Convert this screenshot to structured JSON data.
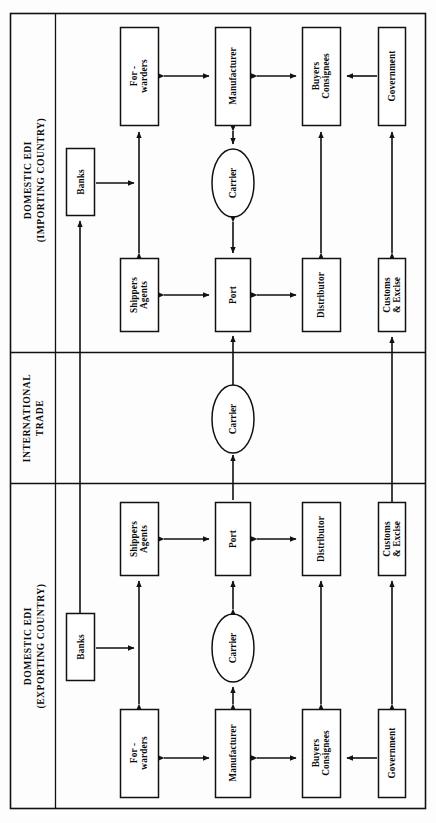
{
  "diagram": {
    "type": "block-flow-diagram",
    "orientation": "rotated-90-ccw",
    "colors": {
      "stroke": "#111111",
      "background": "#fdfdfd",
      "node_fill": "#ffffff",
      "text": "#0b0b0b"
    },
    "sections": [
      {
        "id": "importing",
        "label": "DOMESTIC EDI\n(IMPORTING COUNTRY)",
        "label_line1": "DOMESTIC EDI",
        "label_line2": "(IMPORTING COUNTRY)"
      },
      {
        "id": "international",
        "label": "INTERNATIONAL\nTRADE",
        "label_line1": "INTERNATIONAL",
        "label_line2": "TRADE"
      },
      {
        "id": "exporting",
        "label": "DOMESTIC EDI\n(EXPORTING COUNTRY)",
        "label_line1": "DOMESTIC EDI",
        "label_line2": "(EXPORTING COUNTRY)"
      }
    ],
    "nodes": [
      {
        "id": "imp-forwarders",
        "label": "For -\nwarders",
        "shape": "rect",
        "section": "importing"
      },
      {
        "id": "imp-manufacturer",
        "label": "Manufacturer",
        "shape": "rect",
        "section": "importing"
      },
      {
        "id": "imp-buyers",
        "label": "Buyers\nConsignees",
        "shape": "rect",
        "section": "importing"
      },
      {
        "id": "imp-government",
        "label": "Government",
        "shape": "rect",
        "section": "importing"
      },
      {
        "id": "imp-banks",
        "label": "Banks",
        "shape": "rect",
        "section": "importing"
      },
      {
        "id": "imp-carrier",
        "label": "Carrier",
        "shape": "ellipse",
        "section": "importing"
      },
      {
        "id": "imp-shippers",
        "label": "Shippers\nAgents",
        "shape": "rect",
        "section": "importing"
      },
      {
        "id": "imp-port",
        "label": "Port",
        "shape": "rect",
        "section": "importing"
      },
      {
        "id": "imp-distributor",
        "label": "Distributor",
        "shape": "rect",
        "section": "importing"
      },
      {
        "id": "imp-customs",
        "label": "Customs\n& Excise",
        "shape": "rect",
        "section": "importing"
      },
      {
        "id": "intl-carrier",
        "label": "Carrier",
        "shape": "ellipse",
        "section": "international"
      },
      {
        "id": "exp-shippers",
        "label": "Shippers\nAgents",
        "shape": "rect",
        "section": "exporting"
      },
      {
        "id": "exp-port",
        "label": "Port",
        "shape": "rect",
        "section": "exporting"
      },
      {
        "id": "exp-distributor",
        "label": "Distributor",
        "shape": "rect",
        "section": "exporting"
      },
      {
        "id": "exp-customs",
        "label": "Customs\n& Excise",
        "shape": "rect",
        "section": "exporting"
      },
      {
        "id": "exp-banks",
        "label": "Banks",
        "shape": "rect",
        "section": "exporting"
      },
      {
        "id": "exp-carrier",
        "label": "Carrier",
        "shape": "ellipse",
        "section": "exporting"
      },
      {
        "id": "exp-forwarders",
        "label": "For -\nwarders",
        "shape": "rect",
        "section": "exporting"
      },
      {
        "id": "exp-manufacturer",
        "label": "Manufacturer",
        "shape": "rect",
        "section": "exporting"
      },
      {
        "id": "exp-buyers",
        "label": "Buyers\nConsignees",
        "shape": "rect",
        "section": "exporting"
      },
      {
        "id": "exp-government",
        "label": "Government",
        "shape": "rect",
        "section": "exporting"
      }
    ],
    "edges": [
      {
        "from": "imp-forwarders",
        "to": "imp-manufacturer",
        "arrows": "both"
      },
      {
        "from": "imp-manufacturer",
        "to": "imp-buyers",
        "arrows": "both"
      },
      {
        "from": "imp-government",
        "to": "imp-buyers",
        "arrows": "single"
      },
      {
        "from": "imp-banks",
        "to": "imp-forwarders",
        "arrows": "single"
      },
      {
        "from": "imp-shippers",
        "to": "imp-forwarders",
        "arrows": "both"
      },
      {
        "from": "imp-manufacturer",
        "to": "imp-carrier",
        "arrows": "both"
      },
      {
        "from": "imp-carrier",
        "to": "imp-port",
        "arrows": "both"
      },
      {
        "from": "imp-shippers",
        "to": "imp-port",
        "arrows": "both"
      },
      {
        "from": "imp-port",
        "to": "imp-distributor",
        "arrows": "both"
      },
      {
        "from": "imp-distributor",
        "to": "imp-buyers",
        "arrows": "both"
      },
      {
        "from": "imp-customs",
        "to": "imp-government",
        "arrows": "both"
      },
      {
        "from": "exp-port",
        "to": "intl-carrier",
        "arrows": "single"
      },
      {
        "from": "intl-carrier",
        "to": "imp-port",
        "arrows": "single"
      },
      {
        "from": "exp-customs",
        "to": "imp-customs",
        "arrows": "both"
      },
      {
        "from": "exp-banks",
        "to": "imp-banks",
        "arrows": "both"
      },
      {
        "from": "exp-shippers",
        "to": "exp-port",
        "arrows": "both"
      },
      {
        "from": "exp-port",
        "to": "exp-distributor",
        "arrows": "both"
      },
      {
        "from": "exp-carrier",
        "to": "exp-port",
        "arrows": "both"
      },
      {
        "from": "exp-manufacturer",
        "to": "exp-carrier",
        "arrows": "both"
      },
      {
        "from": "exp-shippers",
        "to": "exp-forwarders",
        "arrows": "both"
      },
      {
        "from": "exp-forwarders",
        "to": "exp-manufacturer",
        "arrows": "both"
      },
      {
        "from": "exp-manufacturer",
        "to": "exp-buyers",
        "arrows": "both"
      },
      {
        "from": "exp-government",
        "to": "exp-buyers",
        "arrows": "single"
      },
      {
        "from": "exp-distributor",
        "to": "exp-buyers",
        "arrows": "both"
      },
      {
        "from": "exp-customs",
        "to": "exp-government",
        "arrows": "both"
      },
      {
        "from": "exp-banks",
        "to": "exp-forwarders",
        "arrows": "single"
      }
    ]
  }
}
